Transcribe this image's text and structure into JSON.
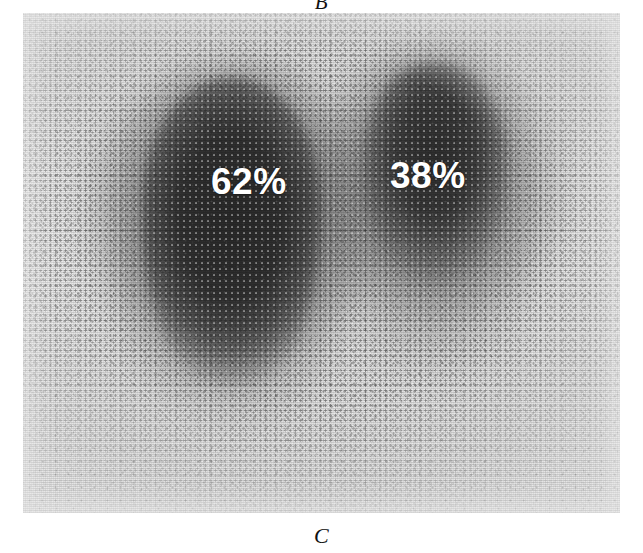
{
  "figure": {
    "panel_label_top": "B",
    "panel_label_bottom": "C",
    "modality": "renal-scintigraphy-scan",
    "colors": {
      "film_background": "#dcdcdc",
      "activity_dark": "#000000",
      "annotation_text": "#ffffff",
      "page_background": "#ffffff",
      "label_text": "#111111"
    }
  },
  "scan": {
    "left_kidney": {
      "label": "62%",
      "value": 62,
      "unit": "%",
      "meaning": "differential-function-left"
    },
    "right_kidney": {
      "label": "38%",
      "value": 38,
      "unit": "%",
      "meaning": "differential-function-right"
    }
  },
  "chart_data": {
    "type": "bar",
    "title": "",
    "categories": [
      "62%",
      "38%"
    ],
    "values": [
      62,
      38
    ],
    "xlabel": "",
    "ylabel": "",
    "ylim": [
      0,
      100
    ],
    "annotations": [
      "62%",
      "38%"
    ],
    "legend": []
  }
}
